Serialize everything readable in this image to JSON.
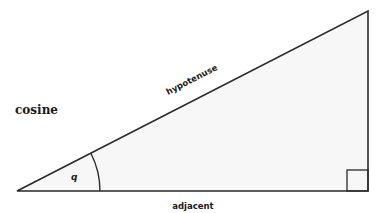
{
  "diagram": {
    "title": "cosine",
    "labels": {
      "hypotenuse": "hypotenuse",
      "adjacent": "adjacent",
      "angle": "q"
    },
    "colors": {
      "stroke": "#2a2a2a",
      "fill": "#f7f7f7",
      "text": "#1a1a1a"
    }
  }
}
